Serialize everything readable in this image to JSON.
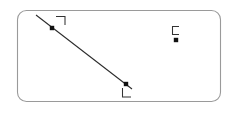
{
  "canvas": {
    "width": 236,
    "height": 113,
    "background_color": "#ffffff"
  },
  "frame": {
    "name": "rounded-rectangle-border",
    "x": 17,
    "y": 10,
    "width": 204,
    "height": 92,
    "corner_radius": 9,
    "stroke_color": "#9a9a9a",
    "fill_color": "#ffffff",
    "stroke_width": 1.1
  },
  "segment": {
    "name": "diagonal-line-segment",
    "x1": 36,
    "y1": 15,
    "x2": 132,
    "y2": 89,
    "stroke_color": "#2b2b2b",
    "stroke_width": 1.05
  },
  "points": [
    {
      "id": "point-a",
      "label": "upper-left-vertex",
      "x": 52,
      "y": 28,
      "dot_size": 4,
      "color": "#111111",
      "mark": {
        "type": "corner-bracket",
        "orientation": "top-right",
        "x": 56,
        "y": 16,
        "size": 9,
        "color": "#333333"
      }
    },
    {
      "id": "point-b",
      "label": "lower-right-vertex",
      "x": 126,
      "y": 84,
      "dot_size": 4,
      "color": "#111111",
      "mark": {
        "type": "corner-bracket",
        "orientation": "bottom-left",
        "x": 122,
        "y": 88,
        "size": 9,
        "color": "#333333"
      }
    },
    {
      "id": "point-c",
      "label": "isolated-right-point",
      "x": 176,
      "y": 40,
      "dot_size": 4,
      "color": "#111111",
      "mark": {
        "type": "bracket-open-right",
        "orientation": "left",
        "x": 172,
        "y": 26,
        "size": 8,
        "color": "#333333"
      }
    }
  ],
  "colors": {
    "ink": "#111111",
    "line": "#2b2b2b",
    "frame": "#9a9a9a",
    "mark": "#333333",
    "background": "#ffffff"
  }
}
